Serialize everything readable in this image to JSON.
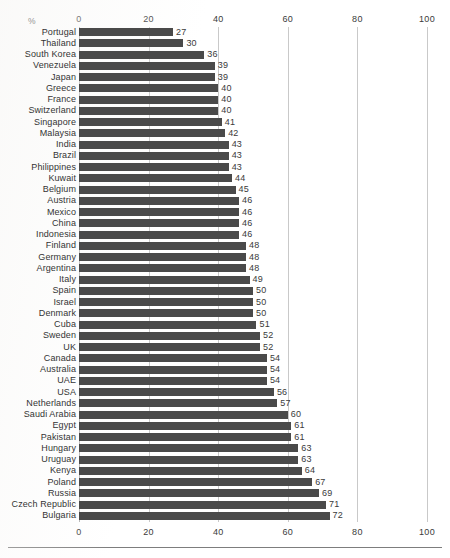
{
  "chart_data": {
    "type": "bar",
    "orientation": "horizontal",
    "title": "",
    "subtitle": "",
    "xlabel": "%",
    "ylabel": "",
    "unit_label": "%",
    "xlim": [
      0,
      100
    ],
    "xticks": [
      0,
      20,
      40,
      60,
      80,
      100
    ],
    "xtick_labels": [
      "0",
      "20",
      "40",
      "60",
      "80",
      "100"
    ],
    "grid": true,
    "grid_axis": "x",
    "legend": null,
    "axis_top": true,
    "axis_bottom": true,
    "bar_color": "#4a4a4a",
    "gridline_color": "#c9c9c9",
    "categories": [
      "Portugal",
      "Thailand",
      "South Korea",
      "Venezuela",
      "Japan",
      "Greece",
      "France",
      "Switzerland",
      "Singapore",
      "Malaysia",
      "India",
      "Brazil",
      "Philippines",
      "Kuwait",
      "Belgium",
      "Austria",
      "Mexico",
      "China",
      "Indonesia",
      "Finland",
      "Germany",
      "Argentina",
      "Italy",
      "Spain",
      "Israel",
      "Denmark",
      "Cuba",
      "Sweden",
      "UK",
      "Canada",
      "Australia",
      "UAE",
      "USA",
      "Netherlands",
      "Saudi Arabia",
      "Egypt",
      "Pakistan",
      "Hungary",
      "Uruguay",
      "Kenya",
      "Poland",
      "Russia",
      "Czech Republic",
      "Bulgaria"
    ],
    "values": [
      27,
      30,
      36,
      39,
      39,
      40,
      40,
      40,
      41,
      42,
      43,
      43,
      43,
      44,
      45,
      46,
      46,
      46,
      46,
      48,
      48,
      48,
      49,
      50,
      50,
      50,
      51,
      52,
      52,
      54,
      54,
      54,
      56,
      57,
      60,
      61,
      61,
      63,
      63,
      64,
      67,
      69,
      71,
      72
    ],
    "value_labels": [
      "27",
      "30",
      "36",
      "39",
      "39",
      "40",
      "40",
      "40",
      "41",
      "42",
      "43",
      "43",
      "43",
      "44",
      "45",
      "46",
      "46",
      "46",
      "46",
      "48",
      "48",
      "48",
      "49",
      "50",
      "50",
      "50",
      "51",
      "52",
      "52",
      "54",
      "54",
      "54",
      "56",
      "57",
      "60",
      "61",
      "61",
      "63",
      "63",
      "64",
      "67",
      "69",
      "71",
      "72"
    ]
  }
}
